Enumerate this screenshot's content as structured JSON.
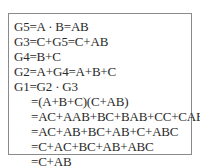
{
  "derivation": {
    "lines": [
      "G5=A · B=AB",
      "G3=C+G5=C+AB",
      "G4=B+C",
      "G2=A+G4=A+B+C",
      "G1=G2 · G3",
      "=(A+B+C)(C+AB)",
      "=AC+AAB+BC+BAB+CC+CAB",
      "=AC+AB+BC+AB+C+ABC",
      "=C+AC+BC+AB+ABC",
      "=C+AB"
    ]
  }
}
